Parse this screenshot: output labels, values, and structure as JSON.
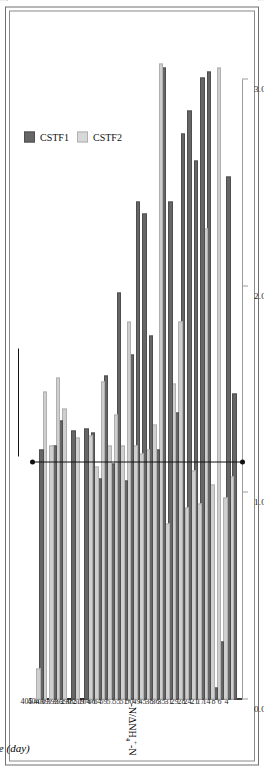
{
  "figure": {
    "value_axis_title_html": "ratio: &Delta;NO<sub>2</sub><sup>-</sup>-N/&Delta;NH<sub>4</sub><sup>+</sup>-N",
    "category_axis_title": "Time (day)",
    "category_axis_title_unit": "day",
    "annotation_line1": "Stoichiometric value: 1.146",
    "annotation_line2": "(Lotti et al., 2014)",
    "annotation_citation_italic": "et al.",
    "stoichiometric_value": 1.146
  },
  "legend": {
    "position": "top-left",
    "entries": [
      {
        "label": "CSTF1",
        "color": "#666666"
      },
      {
        "label": "CSTF2",
        "color": "#cfcfcf"
      }
    ]
  },
  "chart_data": {
    "type": "bar",
    "orientation": "horizontal",
    "title": "",
    "xlabel": "Time (day)",
    "ylabel": "ratio: ΔNO2--N/ΔNH4+-N",
    "ylim": [
      0.0,
      3.0
    ],
    "yticks": [
      "0.0",
      "1.0",
      "2.0",
      "3.0"
    ],
    "grid": false,
    "legend_position": "top-left",
    "categories": [
      "4",
      "6",
      "8",
      "14",
      "17",
      "21",
      "24",
      "28",
      "29",
      "31",
      "35",
      "36",
      "38",
      "45",
      "49",
      "50",
      "51",
      "55",
      "57",
      "59",
      "64",
      "66",
      "104",
      "219",
      "385",
      "390",
      "392",
      "393",
      "397",
      "400",
      "404",
      "405"
    ],
    "series": [
      {
        "name": "CSTF1",
        "color": "#666666",
        "values": [
          0.0,
          1.47,
          2.52,
          0.27,
          0.05,
          3.03,
          3.0,
          2.6,
          2.84,
          2.73,
          1.38,
          2.4,
          3.05,
          1.2,
          1.75,
          2.34,
          2.4,
          1.66,
          1.05,
          1.96,
          1.13,
          1.56,
          1.06,
          1.28,
          1.3,
          0.0,
          1.29,
          0.0,
          1.34,
          1.22,
          0.0,
          1.2
        ]
      },
      {
        "name": "CSTF2",
        "color": "#cfcfcf",
        "values": [
          0.0,
          1.07,
          0.97,
          3.05,
          1.03,
          2.27,
          0.94,
          1.1,
          0.92,
          1.82,
          1.52,
          0.84,
          3.07,
          1.32,
          1.2,
          1.18,
          1.22,
          1.82,
          1.22,
          1.37,
          1.22,
          1.53,
          1.12,
          1.27,
          0.0,
          1.26,
          0.0,
          1.4,
          1.55,
          1.22,
          1.48,
          0.14
        ]
      }
    ],
    "reference_line": {
      "label": "Stoichiometric value: 1.146 (Lotti et al., 2014)",
      "value": 1.146,
      "color": "#111111"
    }
  },
  "annotation_markers": {
    "dot_top": "marker-dot",
    "dot_bottom": "marker-dot"
  }
}
